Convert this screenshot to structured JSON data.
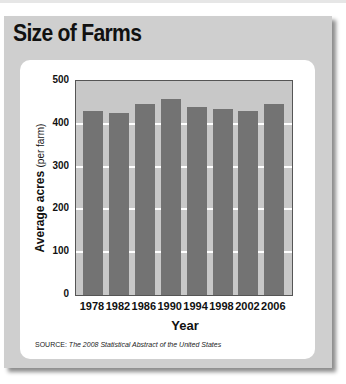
{
  "title": "Size of Farms",
  "source_label": "SOURCE:",
  "source_text": "The 2008 Statistical Abstract of the United States",
  "colors": {
    "panel": "#cfcfcf",
    "plot_bg": "#c8c8c8",
    "bar": "#737373",
    "grid": "#ffffff"
  },
  "chart_data": {
    "type": "bar",
    "title": "Size of Farms",
    "xlabel": "Year",
    "ylabel": "Average acres (per farm)",
    "ylabel_main": "Average acres",
    "ylabel_sub": "(per farm)",
    "categories": [
      "1978",
      "1982",
      "1986",
      "1990",
      "1994",
      "1998",
      "2002",
      "2006"
    ],
    "values": [
      429,
      426,
      447,
      459,
      440,
      434,
      431,
      447
    ],
    "ylim": [
      0,
      500
    ],
    "yticks": [
      "0",
      "100",
      "200",
      "300",
      "400",
      "500"
    ],
    "grid": true,
    "legend": null,
    "source": "SOURCE: The 2008 Statistical Abstract of the United States"
  }
}
